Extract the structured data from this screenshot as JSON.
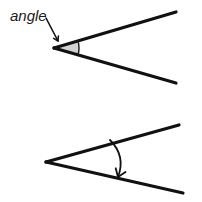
{
  "canvas": {
    "width": 202,
    "height": 202,
    "background": "#ffffff"
  },
  "palette": {
    "stroke": "#111111",
    "sector_fill": "#d2d2d2",
    "sector_stroke": "#1a1a1a",
    "text": "#1a1a1a"
  },
  "annotation": {
    "label": "angle",
    "label_x": 10,
    "label_y": 21,
    "font_style": "italic",
    "font_size": 15
  },
  "pointer_arrow": {
    "name": "angle-pointer-arrow",
    "start_x": 46,
    "start_y": 18,
    "end_x": 58,
    "end_y": 41,
    "stroke_width": 1.6,
    "head_size": 5
  },
  "top_figure": {
    "name": "angle-with-shaded-sector",
    "vertex_x": 54,
    "vertex_y": 48,
    "upper_ray_end_x": 176,
    "upper_ray_end_y": 12,
    "lower_ray_end_x": 176,
    "lower_ray_end_y": 83,
    "stroke_width": 3.2,
    "sector_radius": 25,
    "sector_label": "shaded angle region"
  },
  "bottom_figure": {
    "name": "angle-with-sweep-arrow",
    "vertex_x": 46,
    "vertex_y": 162,
    "upper_ray_end_x": 179,
    "upper_ray_end_y": 125,
    "lower_ray_end_x": 183,
    "lower_ray_end_y": 193,
    "stroke_width": 3.2,
    "arrow_start_x": 110,
    "arrow_start_y": 140,
    "arrow_ctrl_x": 126,
    "arrow_ctrl_y": 156,
    "arrow_end_x": 118,
    "arrow_end_y": 177,
    "arrow_stroke_width": 1.8,
    "arrow_head_size": 9,
    "arrow_label": "angle sweep arrow"
  }
}
